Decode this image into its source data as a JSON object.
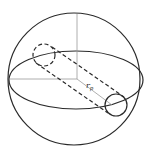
{
  "diagram": {
    "label_radius": {
      "main": "r",
      "subscript": "p"
    }
  }
}
